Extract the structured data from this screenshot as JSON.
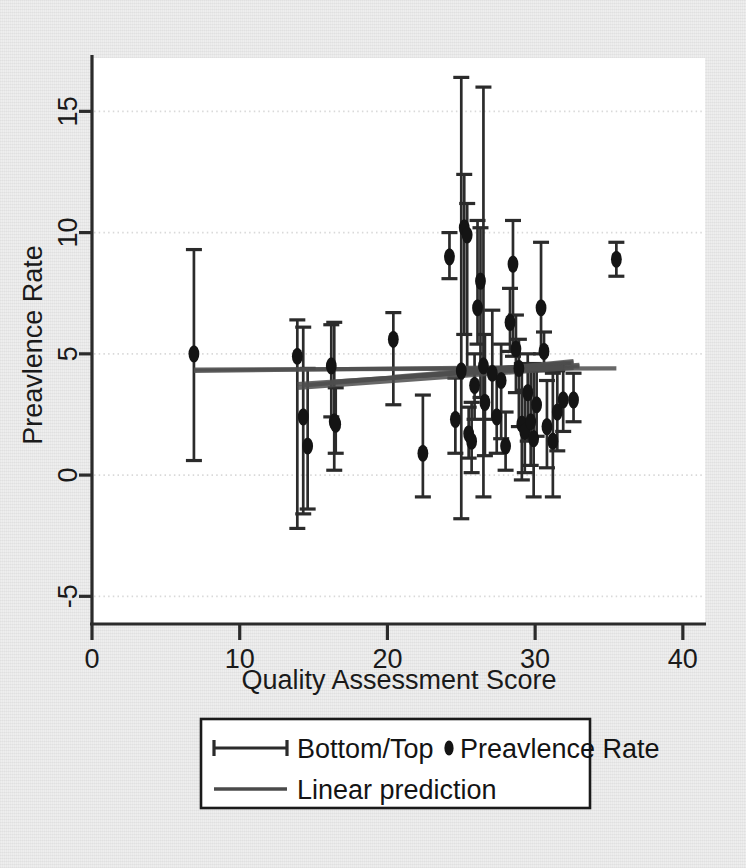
{
  "figure": {
    "background_color": "#eeeeee",
    "plot_background_color": "#ffffff",
    "ink_color": "#2b2b2b",
    "grid_color": "#d8d8d8"
  },
  "chart_data": {
    "type": "scatter",
    "title": "",
    "xlabel": "Quality Assessment Score",
    "ylabel": "Preavlence Rate",
    "xlim": [
      0,
      41.5
    ],
    "ylim": [
      -6.1,
      17.2
    ],
    "xticks": [
      0,
      10,
      20,
      30,
      40
    ],
    "xtick_labels": [
      "0",
      "10",
      "20",
      "30",
      "40"
    ],
    "yticks": [
      -5,
      0,
      5,
      10,
      15
    ],
    "ytick_labels": [
      "-5",
      "0",
      "5",
      "10",
      "15"
    ],
    "grid": "horizontal-dotted",
    "grid_values": [
      -5,
      0,
      5,
      10,
      15
    ],
    "legend_position": "below-plot",
    "marker": "filled-circle",
    "error_bar_style": "capped-vertical",
    "series": [
      {
        "name": "Bottom/Top",
        "type": "errorbar",
        "marker_label": "Preavlence Rate",
        "points": [
          {
            "x": 6.9,
            "y": 5.0,
            "low": 0.6,
            "high": 9.3
          },
          {
            "x": 13.9,
            "y": 4.9,
            "low": -2.2,
            "high": 6.4
          },
          {
            "x": 14.3,
            "y": 2.4,
            "low": -1.6,
            "high": 6.1
          },
          {
            "x": 14.6,
            "y": 1.2,
            "low": -1.4,
            "high": 4.4
          },
          {
            "x": 16.2,
            "y": 4.5,
            "low": 2.4,
            "high": 6.2
          },
          {
            "x": 16.4,
            "y": 2.2,
            "low": 0.2,
            "high": 6.3
          },
          {
            "x": 16.5,
            "y": 2.1,
            "low": 0.9,
            "high": 3.6
          },
          {
            "x": 20.4,
            "y": 5.6,
            "low": 2.9,
            "high": 6.7
          },
          {
            "x": 22.4,
            "y": 0.9,
            "low": -0.9,
            "high": 3.3
          },
          {
            "x": 24.2,
            "y": 9.0,
            "low": 8.1,
            "high": 10.0
          },
          {
            "x": 24.6,
            "y": 2.3,
            "low": 0.9,
            "high": 4.0
          },
          {
            "x": 25.0,
            "y": 4.3,
            "low": -1.8,
            "high": 16.4
          },
          {
            "x": 25.2,
            "y": 10.2,
            "low": 5.8,
            "high": 12.4
          },
          {
            "x": 25.4,
            "y": 9.9,
            "low": 4.4,
            "high": 11.2
          },
          {
            "x": 25.5,
            "y": 1.7,
            "low": 0.7,
            "high": 2.8
          },
          {
            "x": 25.7,
            "y": 1.4,
            "low": 0.1,
            "high": 3.0
          },
          {
            "x": 25.9,
            "y": 3.7,
            "low": 2.3,
            "high": 5.0
          },
          {
            "x": 26.1,
            "y": 6.9,
            "low": 5.4,
            "high": 10.5
          },
          {
            "x": 26.3,
            "y": 8.0,
            "low": 3.2,
            "high": 10.2
          },
          {
            "x": 26.5,
            "y": 4.5,
            "low": -0.9,
            "high": 16.0
          },
          {
            "x": 26.6,
            "y": 3.0,
            "low": 0.8,
            "high": 5.8
          },
          {
            "x": 27.1,
            "y": 4.2,
            "low": 2.3,
            "high": 6.8
          },
          {
            "x": 27.4,
            "y": 2.4,
            "low": 0.9,
            "high": 4.0
          },
          {
            "x": 27.7,
            "y": 3.9,
            "low": 1.5,
            "high": 5.4
          },
          {
            "x": 28.0,
            "y": 1.2,
            "low": 0.2,
            "high": 2.6
          },
          {
            "x": 28.3,
            "y": 6.3,
            "low": 5.1,
            "high": 7.7
          },
          {
            "x": 28.5,
            "y": 8.7,
            "low": 4.9,
            "high": 10.5
          },
          {
            "x": 28.7,
            "y": 5.2,
            "low": 3.4,
            "high": 6.6
          },
          {
            "x": 28.9,
            "y": 4.4,
            "low": 2.0,
            "high": 5.6
          },
          {
            "x": 29.1,
            "y": 2.1,
            "low": -0.2,
            "high": 4.6
          },
          {
            "x": 29.3,
            "y": 1.8,
            "low": 0.1,
            "high": 3.5
          },
          {
            "x": 29.5,
            "y": 3.4,
            "low": 1.4,
            "high": 5.0
          },
          {
            "x": 29.7,
            "y": 2.2,
            "low": 0.4,
            "high": 4.3
          },
          {
            "x": 29.9,
            "y": 1.5,
            "low": -0.9,
            "high": 4.6
          },
          {
            "x": 30.1,
            "y": 2.9,
            "low": 1.6,
            "high": 4.4
          },
          {
            "x": 30.4,
            "y": 6.9,
            "low": 5.0,
            "high": 9.6
          },
          {
            "x": 30.6,
            "y": 5.1,
            "low": 4.3,
            "high": 5.9
          },
          {
            "x": 30.8,
            "y": 2.0,
            "low": 0.3,
            "high": 3.9
          },
          {
            "x": 31.2,
            "y": 1.4,
            "low": -0.9,
            "high": 4.2
          },
          {
            "x": 31.5,
            "y": 2.6,
            "low": 1.0,
            "high": 4.3
          },
          {
            "x": 31.9,
            "y": 3.1,
            "low": 1.8,
            "high": 4.6
          },
          {
            "x": 32.6,
            "y": 3.1,
            "low": 2.2,
            "high": 4.2
          },
          {
            "x": 35.5,
            "y": 8.9,
            "low": 8.2,
            "high": 9.6
          }
        ]
      },
      {
        "name": "Linear prediction",
        "type": "line",
        "description": "bundle of near-flat slightly-rising fitted lines",
        "lines": [
          {
            "x0": 6.9,
            "y0": 4.35,
            "x1": 35.5,
            "y1": 4.4
          },
          {
            "x0": 6.9,
            "y0": 4.3,
            "x1": 33.0,
            "y1": 4.48
          },
          {
            "x0": 13.9,
            "y0": 3.75,
            "x1": 33.0,
            "y1": 4.55
          },
          {
            "x0": 13.9,
            "y0": 3.6,
            "x1": 32.6,
            "y1": 4.42
          },
          {
            "x0": 14.3,
            "y0": 3.7,
            "x1": 32.0,
            "y1": 4.6
          },
          {
            "x0": 16.2,
            "y0": 3.85,
            "x1": 31.9,
            "y1": 4.5
          },
          {
            "x0": 20.4,
            "y0": 4.05,
            "x1": 32.6,
            "y1": 4.65
          },
          {
            "x0": 22.4,
            "y0": 4.1,
            "x1": 31.5,
            "y1": 4.55
          },
          {
            "x0": 24.2,
            "y0": 4.2,
            "x1": 32.6,
            "y1": 4.7
          },
          {
            "x0": 25.0,
            "y0": 4.15,
            "x1": 31.9,
            "y1": 4.45
          }
        ]
      }
    ]
  },
  "legend": {
    "items": [
      {
        "id": "bottom-top",
        "label": "Bottom/Top",
        "symbol": "errorbar-horizontal"
      },
      {
        "id": "preavlence-rate",
        "label": "Preavlence Rate",
        "symbol": "dot"
      },
      {
        "id": "linear-prediction",
        "label": "Linear prediction",
        "symbol": "line"
      }
    ]
  }
}
